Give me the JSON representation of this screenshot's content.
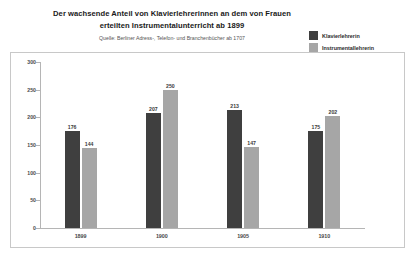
{
  "chart_data": {
    "type": "bar",
    "title": "Der wachsende Anteil von Klavierlehrerinnen an dem von Frauen erteilten Instrumentalunterricht ab 1899",
    "title_line1": "Der wachsende Anteil von Klavierlehrerinnen an dem von Frauen",
    "title_line2": "erteilten Instrumentalunterricht ab 1899",
    "subtitle": "Quelle: Berliner Adress-, Telefon- und Branchenbücher ab 1707",
    "categories": [
      "1899",
      "1900",
      "1905",
      "1910"
    ],
    "series": [
      {
        "name": "Klavierlehrerin",
        "color": "#3f3f3f",
        "values": [
          176,
          207,
          213,
          175
        ]
      },
      {
        "name": "Instrumentallehrerin",
        "color": "#a6a6a6",
        "values": [
          144,
          250,
          147,
          202
        ]
      }
    ],
    "ylim": [
      0,
      300
    ],
    "yticks": [
      "0",
      "50",
      "100",
      "150",
      "200",
      "250",
      "300"
    ],
    "ytick_values": [
      0,
      50,
      100,
      150,
      200,
      250,
      300
    ],
    "xlabel": "",
    "ylabel": "",
    "grid": false,
    "legend_position": "top-right"
  }
}
